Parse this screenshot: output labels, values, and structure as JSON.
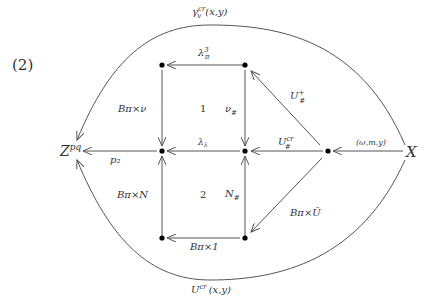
{
  "equation_number": "(2)",
  "colors": {
    "line": "#555555",
    "text": "#333333",
    "node": "#000000"
  },
  "nodes": {
    "Z": {
      "label": "Z",
      "sup": "pq"
    },
    "X": {
      "label": "X"
    }
  },
  "labels": {
    "top_curve": {
      "main": "γ",
      "sup": "cr",
      "sub": "v",
      "args": "(x,y)"
    },
    "bottom_curve": {
      "main": "U",
      "sup": "cr",
      "args": "(x,y)"
    },
    "top_edge": {
      "main": "λ",
      "sup": "3",
      "sub": "π"
    },
    "left_upper": "Bπ×ν",
    "left_lower": "Bπ×N",
    "right_upper": {
      "main": "ν",
      "sub": "#"
    },
    "right_lower": {
      "main": "N",
      "sub": "#"
    },
    "mid_edge": {
      "main": "λ",
      "sub": "λ"
    },
    "u_cr_edge": {
      "main": "U",
      "sup": "cr",
      "sub": "#"
    },
    "u_plus_edge": {
      "main": "U",
      "sup": "+",
      "sub": "#"
    },
    "diag_lower": "Bπ×Ū",
    "bottom_edge": "Bπ×1",
    "p2": "p₂",
    "x_edge": "(ω,m,y)",
    "region1": "1",
    "region2": "2"
  }
}
